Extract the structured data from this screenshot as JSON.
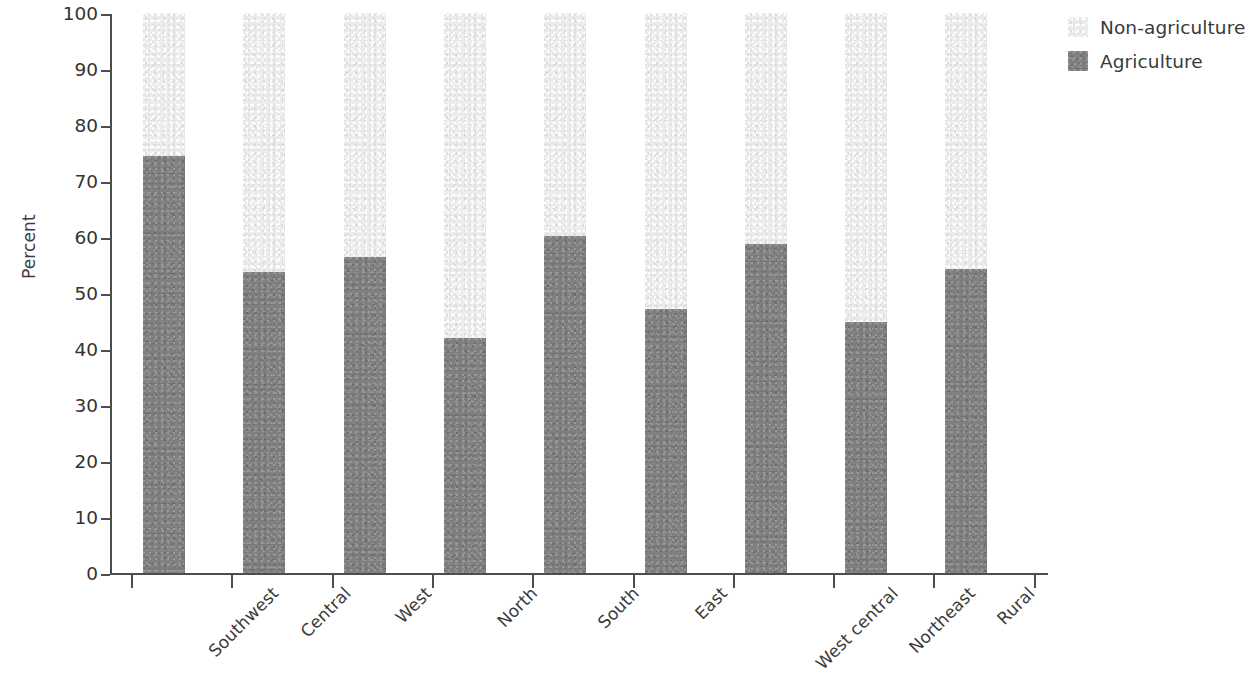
{
  "chart_data": {
    "type": "bar",
    "subtype": "stacked-bar-100",
    "title": "",
    "subtitle": "",
    "xlabel": "",
    "ylabel": "Percent",
    "ylim": [
      0,
      100
    ],
    "yticks": [
      0,
      10,
      20,
      30,
      40,
      50,
      60,
      70,
      80,
      90,
      100
    ],
    "ytick_labels": [
      "0",
      "10",
      "20",
      "30",
      "40",
      "50",
      "60",
      "70",
      "80",
      "90",
      "100"
    ],
    "grid": false,
    "legend_position": "top-right",
    "categories": [
      "Southwest",
      "Central",
      "West",
      "North",
      "South",
      "East",
      "West central",
      "Northeast",
      "Rural"
    ],
    "series": [
      {
        "name": "Non-agriculture",
        "color": "#ececec",
        "values": [
          25.5,
          46.2,
          43.5,
          58.0,
          39.8,
          52.8,
          41.2,
          55.2,
          45.8
        ]
      },
      {
        "name": "Agriculture",
        "color": "#808080",
        "values": [
          74.5,
          53.8,
          56.5,
          42.0,
          60.2,
          47.2,
          58.8,
          44.8,
          54.2
        ]
      }
    ]
  },
  "legend": {
    "items": [
      {
        "label": "Non-agriculture",
        "color": "#ececec"
      },
      {
        "label": "Agriculture",
        "color": "#808080"
      }
    ]
  },
  "axes": {
    "y_title": "Percent",
    "axis_color": "#4d4d4d"
  }
}
